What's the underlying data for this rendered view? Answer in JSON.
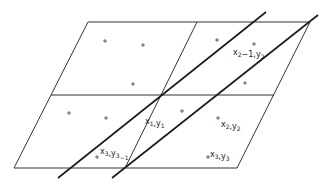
{
  "diagram": {
    "labels": [
      {
        "id": "p1",
        "base": "x",
        "sub": "1",
        "sep": ",",
        "base2": "y",
        "sub2": "1",
        "suffix": "",
        "x": 145,
        "y": 124
      },
      {
        "id": "p2",
        "base": "x",
        "sub": "2",
        "sep": ",",
        "base2": "y",
        "sub2": "2",
        "suffix": "",
        "x": 221,
        "y": 127
      },
      {
        "id": "p3",
        "base": "x",
        "sub": "3",
        "sep": ",",
        "base2": "y",
        "sub2": "3",
        "suffix": "",
        "x": 210,
        "y": 157
      },
      {
        "id": "p4",
        "base": "x",
        "sub": "2",
        "sep": "−1,",
        "base2": "y",
        "sub2": "2",
        "suffix": "",
        "x": 233,
        "y": 55
      },
      {
        "id": "p5",
        "base": "x",
        "sub": "3",
        "sep": ",",
        "base2": "y",
        "sub2": "3",
        "suffix": "−1",
        "x": 100,
        "y": 154
      }
    ],
    "points": [
      [
        105,
        41
      ],
      [
        143,
        45
      ],
      [
        133,
        84
      ],
      [
        217,
        40
      ],
      [
        254,
        44
      ],
      [
        245,
        83
      ],
      [
        69,
        113
      ],
      [
        106,
        118
      ],
      [
        182,
        111
      ],
      [
        218,
        118
      ],
      [
        208,
        157
      ],
      [
        97,
        157
      ]
    ],
    "colors": {
      "background": "#ffffff",
      "line": "#333333",
      "thick_line": "#1a1a1a"
    }
  }
}
